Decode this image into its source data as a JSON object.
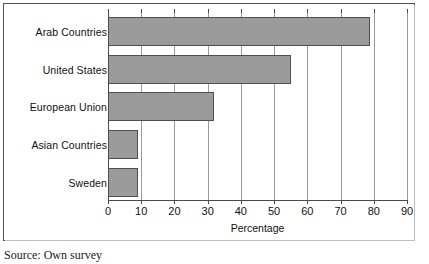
{
  "caption": {
    "source_text": "Source: Own survey"
  },
  "chart_data": {
    "type": "bar",
    "orientation": "horizontal",
    "title": "",
    "subtitle": "",
    "xlabel": "Percentage",
    "ylabel": "",
    "categories": [
      "Arab Countries",
      "United States",
      "European Union",
      "Asian Countries",
      "Sweden"
    ],
    "values": [
      79,
      55,
      32,
      9,
      9
    ],
    "series": [
      {
        "name": "Percentage",
        "values": [
          79,
          55,
          32,
          9,
          9
        ]
      }
    ],
    "xlim": [
      0,
      90
    ],
    "xticks": [
      0,
      10,
      20,
      30,
      40,
      50,
      60,
      70,
      80,
      90
    ],
    "xtick_labels": [
      "0",
      "10",
      "20",
      "30",
      "40",
      "50",
      "60",
      "70",
      "80",
      "90"
    ],
    "grid": "vertical",
    "legend": "none",
    "bar_color": "#9b9b9b",
    "bar_border_color": "#4f4f4f",
    "axis_color": "#4a4a4a",
    "gridline_color": "#9a9a9a",
    "background_color": "#ffffff"
  }
}
